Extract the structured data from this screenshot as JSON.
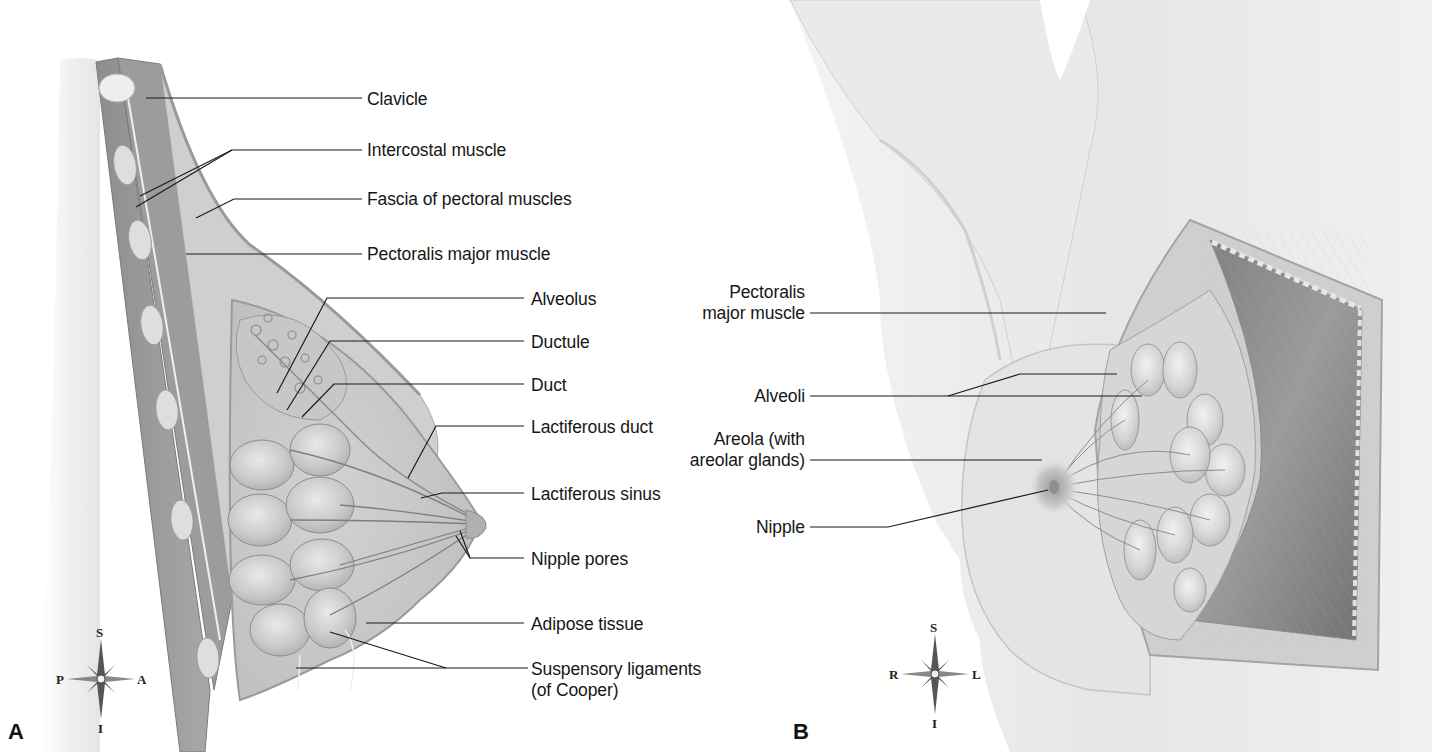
{
  "figure": {
    "panels": [
      {
        "id": "A",
        "letter": "A",
        "view": "sagittal section",
        "compass": {
          "top": "S",
          "bottom": "I",
          "left": "P",
          "right": "A"
        },
        "labels": [
          {
            "key": "clavicle",
            "text": "Clavicle"
          },
          {
            "key": "intercostal",
            "text": "Intercostal muscle"
          },
          {
            "key": "fascia",
            "text": "Fascia of pectoral muscles"
          },
          {
            "key": "pectoralis",
            "text": "Pectoralis major muscle"
          },
          {
            "key": "alveolus",
            "text": "Alveolus"
          },
          {
            "key": "ductule",
            "text": "Ductule"
          },
          {
            "key": "duct",
            "text": "Duct"
          },
          {
            "key": "lactiferous_duct",
            "text": "Lactiferous duct"
          },
          {
            "key": "lactiferous_sinus",
            "text": "Lactiferous sinus"
          },
          {
            "key": "nipple_pores",
            "text": "Nipple pores"
          },
          {
            "key": "adipose",
            "text": "Adipose tissue"
          },
          {
            "key": "suspensory_1",
            "text": "Suspensory ligaments"
          },
          {
            "key": "suspensory_2",
            "text": "(of Cooper)"
          }
        ]
      },
      {
        "id": "B",
        "letter": "B",
        "view": "anterior view, dissected",
        "compass": {
          "top": "S",
          "bottom": "I",
          "left": "R",
          "right": "L"
        },
        "labels": [
          {
            "key": "pectoralis_1",
            "text": "Pectoralis"
          },
          {
            "key": "pectoralis_2",
            "text": "major muscle"
          },
          {
            "key": "alveoli",
            "text": "Alveoli"
          },
          {
            "key": "areola_1",
            "text": "Areola (with"
          },
          {
            "key": "areola_2",
            "text": "areolar glands)"
          },
          {
            "key": "nipple",
            "text": "Nipple"
          }
        ]
      }
    ],
    "colors": {
      "tissue_light": "#d9d9d9",
      "tissue_mid": "#b8b8b8",
      "tissue_dark": "#8a8a8a",
      "muscle": "#9a9a9a",
      "skin": "#ececec",
      "leader_line": "#1a1a1a"
    }
  }
}
